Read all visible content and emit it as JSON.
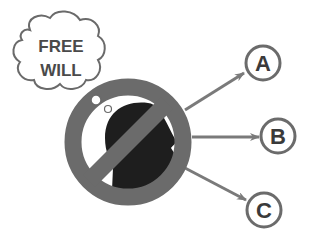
{
  "thought_bubble": {
    "line1": "FREE",
    "line2": "WILL"
  },
  "options": [
    {
      "label": "A"
    },
    {
      "label": "B"
    },
    {
      "label": "C"
    }
  ],
  "colors": {
    "ring": "#6b6b6b",
    "head": "#1e1e1e",
    "arrow": "#7a7a7a",
    "text": "#4a4a4a",
    "bubble_stroke": "#6a6a6a"
  }
}
